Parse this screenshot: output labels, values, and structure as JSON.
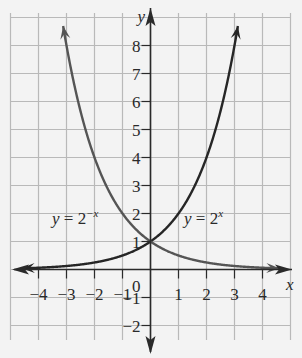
{
  "chart_data": {
    "type": "line",
    "title": "",
    "xlabel": "x",
    "ylabel": "y",
    "xlim": [
      -4.9,
      5
    ],
    "ylim": [
      -3.3,
      9
    ],
    "grid": true,
    "x_ticks": [
      "−4",
      "−3",
      "−2",
      "−1",
      "1",
      "2",
      "3",
      "4"
    ],
    "x_tick_values": [
      -4,
      -3,
      -2,
      -1,
      1,
      2,
      3,
      4
    ],
    "y_ticks": [
      "8",
      "7",
      "6",
      "5",
      "4",
      "3",
      "2",
      "1",
      "−1",
      "−2"
    ],
    "y_tick_values": [
      8,
      7,
      6,
      5,
      4,
      3,
      2,
      1,
      -1,
      -2
    ],
    "origin_label": "0",
    "series": [
      {
        "name": "y = 2^x",
        "label_main": "y = 2",
        "label_exp": "x",
        "color": "#262626",
        "x": [
          -4.5,
          -4,
          -3,
          -2,
          -1,
          0,
          1,
          2,
          3,
          3.1
        ],
        "y": [
          0.044,
          0.0625,
          0.125,
          0.25,
          0.5,
          1,
          2,
          4,
          8,
          8.57
        ]
      },
      {
        "name": "y = 2^-x",
        "label_main": "y = 2",
        "label_exp": "−x",
        "color": "#555555",
        "x": [
          -3.1,
          -3,
          -2,
          -1,
          0,
          1,
          2,
          3,
          4,
          4.5
        ],
        "y": [
          8.57,
          8,
          4,
          2,
          1,
          0.5,
          0.25,
          0.125,
          0.0625,
          0.044
        ]
      }
    ],
    "colors": {
      "background": "#f3f3f3",
      "grid": "#b9b9b9",
      "axis": "#2a2a2a"
    }
  }
}
